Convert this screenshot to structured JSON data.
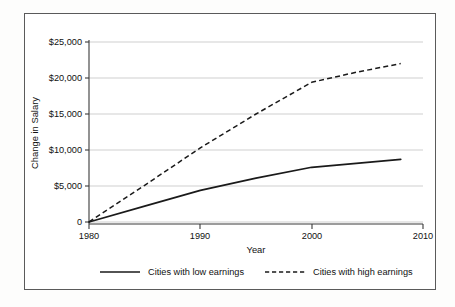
{
  "chart_data": {
    "type": "line",
    "title": "",
    "xlabel": "Year",
    "ylabel": "Change in Salary",
    "xlim": [
      1980,
      2010
    ],
    "ylim": [
      0,
      25000
    ],
    "grid": true,
    "legend_position": "bottom",
    "x_ticks": [
      "1980",
      "1990",
      "2000",
      "2010"
    ],
    "x_tick_values": [
      1980,
      1990,
      2000,
      2010
    ],
    "y_ticks": [
      "0",
      "$5,000",
      "$10,000",
      "$15,000",
      "$20,000",
      "$25,000"
    ],
    "y_tick_values": [
      0,
      5000,
      10000,
      15000,
      20000,
      25000
    ],
    "series": [
      {
        "name": "Cities with low earnings",
        "style": "solid",
        "x": [
          1980,
          1985,
          1990,
          1995,
          2000,
          2004,
          2008
        ],
        "values": [
          0,
          2200,
          4400,
          6100,
          7600,
          8150,
          8700
        ]
      },
      {
        "name": "Cities with high earnings",
        "style": "dashed",
        "x": [
          1980,
          1985,
          1990,
          1995,
          2000,
          2004,
          2008
        ],
        "values": [
          0,
          5100,
          10300,
          15000,
          19400,
          20800,
          22000
        ]
      }
    ]
  },
  "legend": {
    "items": [
      {
        "label": "Cities with low earnings",
        "style": "solid"
      },
      {
        "label": "Cities with high earnings",
        "style": "dashed"
      }
    ]
  }
}
